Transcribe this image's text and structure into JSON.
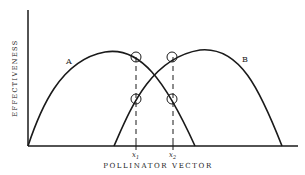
{
  "diagram": {
    "y_axis_label": "EFFECTIVENESS",
    "x_axis_label": "POLLINATOR VECTOR",
    "curves": [
      {
        "label": "A",
        "start_x": 28,
        "peak": [
          105,
          52
        ],
        "end_x": 195
      },
      {
        "label": "B",
        "start_x": 114,
        "peak": [
          200,
          50
        ],
        "end_x": 282
      }
    ],
    "markers": [
      {
        "label": "x",
        "subscript": "1",
        "x": 136
      },
      {
        "label": "x",
        "subscript": "2",
        "x": 173
      }
    ],
    "colors": {
      "line": "#1a1a1a",
      "background": "#ffffff"
    }
  }
}
